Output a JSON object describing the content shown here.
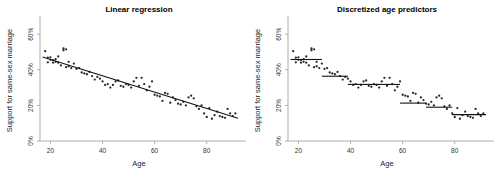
{
  "figure": {
    "width": 497,
    "height": 177,
    "background": "#ffffff",
    "ink_color": "#111111",
    "point_color": "#2b2b2b",
    "axis_color": "#9a9a9a"
  },
  "chart_data": [
    {
      "type": "scatter",
      "panel_index": 0,
      "title": "Linear regression",
      "xlabel": "Age",
      "ylabel": "Support for same-sex marriage",
      "xlim": [
        16,
        92
      ],
      "ylim": [
        0,
        68
      ],
      "xticks": [
        20,
        40,
        60,
        80
      ],
      "xticklabels": [
        "20",
        "40",
        "60",
        "80"
      ],
      "yticks": [
        0,
        20,
        40,
        60
      ],
      "yticklabels": [
        "0%",
        "20%",
        "40%",
        "60%"
      ],
      "grid": false,
      "legend": null,
      "x": [
        18,
        19,
        19,
        20,
        20,
        21,
        21,
        22,
        22,
        23,
        23,
        24,
        25,
        25,
        26,
        26,
        27,
        27,
        28,
        29,
        30,
        31,
        32,
        33,
        34,
        35,
        36,
        37,
        38,
        39,
        40,
        41,
        42,
        43,
        44,
        45,
        46,
        47,
        48,
        49,
        50,
        51,
        52,
        53,
        54,
        55,
        56,
        57,
        58,
        59,
        60,
        61,
        62,
        63,
        64,
        65,
        66,
        67,
        68,
        69,
        70,
        71,
        72,
        73,
        74,
        75,
        76,
        77,
        78,
        79,
        80,
        81,
        82,
        83,
        84,
        85,
        86,
        87,
        88,
        89,
        90,
        91
      ],
      "y": [
        50.5,
        46.8,
        44.2,
        45.6,
        47.0,
        45.5,
        44.0,
        44.5,
        46.0,
        44.0,
        47.5,
        42.5,
        52.0,
        51.0,
        51.5,
        41.5,
        42.0,
        44.5,
        41.0,
        43.5,
        40.5,
        41.0,
        38.5,
        38.0,
        37.5,
        38.8,
        36.5,
        34.5,
        36.0,
        35.0,
        33.5,
        31.5,
        32.0,
        30.0,
        31.5,
        33.5,
        34.0,
        31.0,
        30.5,
        32.0,
        31.5,
        30.0,
        33.5,
        35.5,
        31.0,
        35.5,
        32.0,
        28.5,
        30.5,
        33.5,
        26.0,
        25.5,
        25.0,
        22.5,
        27.0,
        26.5,
        21.5,
        24.5,
        23.0,
        21.0,
        20.5,
        22.0,
        20.0,
        24.5,
        25.5,
        24.0,
        19.5,
        18.0,
        20.0,
        15.5,
        13.5,
        18.5,
        12.5,
        14.5,
        16.5,
        14.0,
        13.5,
        13.0,
        18.0,
        15.5,
        14.0,
        15.5
      ],
      "fit_line": {
        "label": "ordinary least squares fit",
        "x_start": 17,
        "x_end": 92,
        "y_start": 47.2,
        "y_end": 12.8,
        "slope": -0.4587,
        "intercept": 55.0
      }
    },
    {
      "type": "scatter",
      "panel_index": 1,
      "title": "Discretized age predictors",
      "xlabel": "Age",
      "ylabel": "Support for same-sex marriage",
      "xlim": [
        16,
        92
      ],
      "ylim": [
        0,
        68
      ],
      "xticks": [
        20,
        40,
        60,
        80
      ],
      "xticklabels": [
        "20",
        "40",
        "60",
        "80"
      ],
      "yticks": [
        0,
        20,
        40,
        60
      ],
      "yticklabels": [
        "0%",
        "20%",
        "40%",
        "60%"
      ],
      "grid": false,
      "legend": null,
      "x": [
        18,
        19,
        19,
        20,
        20,
        21,
        21,
        22,
        22,
        23,
        23,
        24,
        25,
        25,
        26,
        26,
        27,
        27,
        28,
        29,
        30,
        31,
        32,
        33,
        34,
        35,
        36,
        37,
        38,
        39,
        40,
        41,
        42,
        43,
        44,
        45,
        46,
        47,
        48,
        49,
        50,
        51,
        52,
        53,
        54,
        55,
        56,
        57,
        58,
        59,
        60,
        61,
        62,
        63,
        64,
        65,
        66,
        67,
        68,
        69,
        70,
        71,
        72,
        73,
        74,
        75,
        76,
        77,
        78,
        79,
        80,
        81,
        82,
        83,
        84,
        85,
        86,
        87,
        88,
        89,
        90,
        91
      ],
      "y": [
        50.5,
        46.8,
        44.2,
        45.6,
        47.0,
        45.5,
        44.0,
        44.5,
        46.0,
        44.0,
        47.5,
        42.5,
        52.0,
        51.0,
        51.5,
        41.5,
        42.0,
        44.5,
        41.0,
        43.5,
        40.5,
        41.0,
        38.5,
        38.0,
        37.5,
        38.8,
        36.5,
        34.5,
        36.0,
        35.0,
        33.5,
        31.5,
        32.0,
        30.0,
        31.5,
        33.5,
        34.0,
        31.0,
        30.5,
        32.0,
        31.5,
        30.0,
        33.5,
        35.5,
        31.0,
        35.5,
        32.0,
        28.5,
        30.5,
        33.5,
        26.0,
        25.5,
        25.0,
        22.5,
        27.0,
        26.5,
        21.5,
        24.5,
        23.0,
        21.0,
        20.5,
        22.0,
        20.0,
        24.5,
        25.5,
        24.0,
        19.5,
        18.0,
        20.0,
        15.5,
        13.5,
        18.5,
        12.5,
        14.5,
        16.5,
        14.0,
        13.5,
        13.0,
        18.0,
        15.5,
        14.0,
        15.5
      ],
      "step_segments": [
        {
          "x_start": 17,
          "x_end": 29,
          "value": 45.8,
          "bin_label": "18-29"
        },
        {
          "x_start": 29,
          "x_end": 39,
          "value": 36.4,
          "bin_label": "30-39"
        },
        {
          "x_start": 39,
          "x_end": 49,
          "value": 31.8,
          "bin_label": "40-49"
        },
        {
          "x_start": 49,
          "x_end": 59,
          "value": 31.8,
          "bin_label": "50-59"
        },
        {
          "x_start": 59,
          "x_end": 69,
          "value": 21.3,
          "bin_label": "60-69"
        },
        {
          "x_start": 69,
          "x_end": 79,
          "value": 19.0,
          "bin_label": "70-79"
        },
        {
          "x_start": 79,
          "x_end": 92,
          "value": 14.8,
          "bin_label": "80+"
        }
      ]
    }
  ]
}
